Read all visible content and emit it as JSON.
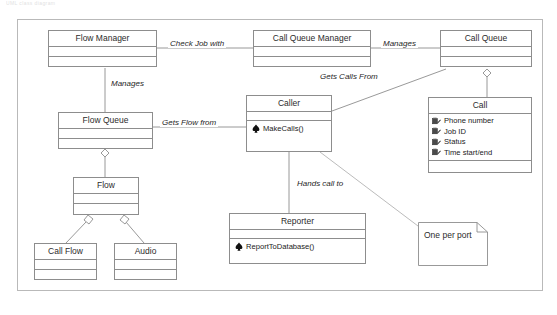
{
  "figure": {
    "top_sliver_text": "UML   class   diagram",
    "border_color": "#b9b9b9",
    "line_color": "#8d8d8d",
    "background": "#ffffff"
  },
  "classes": [
    {
      "id": "flow-manager",
      "name": "Flow Manager",
      "attributes": [],
      "operations": []
    },
    {
      "id": "call-queue-manager",
      "name": "Call Queue Manager",
      "attributes": [],
      "operations": []
    },
    {
      "id": "call-queue",
      "name": "Call Queue",
      "attributes": [],
      "operations": []
    },
    {
      "id": "flow-queue",
      "name": "Flow Queue",
      "attributes": [],
      "operations": []
    },
    {
      "id": "caller",
      "name": "Caller",
      "attributes": [],
      "operations": [
        "MakeCalls()"
      ]
    },
    {
      "id": "call",
      "name": "Call",
      "attributes": [
        "Phone number",
        "Job ID",
        "Status",
        "Time start/end"
      ],
      "operations": []
    },
    {
      "id": "flow",
      "name": "Flow",
      "attributes": [],
      "operations": []
    },
    {
      "id": "call-flow",
      "name": "Call Flow",
      "attributes": [],
      "operations": []
    },
    {
      "id": "audio",
      "name": "Audio",
      "attributes": [],
      "operations": []
    },
    {
      "id": "reporter",
      "name": "Reporter",
      "attributes": [],
      "operations": [
        "ReportToDatabase()"
      ]
    }
  ],
  "notes": [
    {
      "id": "one-per-port",
      "text": "One per port"
    }
  ],
  "relationships": [
    {
      "id": "check-job-with",
      "label": "Check Job with",
      "from": "Flow Manager",
      "to": "Call Queue Manager",
      "kind": "association"
    },
    {
      "id": "manages-queue",
      "label": "Manages",
      "from": "Call Queue Manager",
      "to": "Call Queue",
      "kind": "association"
    },
    {
      "id": "manages-flow",
      "label": "Manages",
      "from": "Flow Manager",
      "to": "Flow Queue",
      "kind": "association"
    },
    {
      "id": "gets-flow-from",
      "label": "Gets Flow from",
      "from": "Flow Queue",
      "to": "Caller",
      "kind": "association"
    },
    {
      "id": "gets-calls-from",
      "label": "Gets Calls From",
      "from": "Caller",
      "to": "Call Queue",
      "kind": "association"
    },
    {
      "id": "hands-call-to",
      "label": "Hands call to",
      "from": "Caller",
      "to": "Reporter",
      "kind": "association"
    },
    {
      "id": "queue-has-call",
      "label": "",
      "from": "Call Queue",
      "to": "Call",
      "kind": "aggregation"
    },
    {
      "id": "flowqueue-has-flow",
      "label": "",
      "from": "Flow Queue",
      "to": "Flow",
      "kind": "aggregation"
    },
    {
      "id": "flow-has-callflow",
      "label": "",
      "from": "Flow",
      "to": "Call Flow",
      "kind": "aggregation"
    },
    {
      "id": "flow-has-audio",
      "label": "",
      "from": "Flow",
      "to": "Audio",
      "kind": "aggregation"
    },
    {
      "id": "note-anchor",
      "label": "",
      "from": "Caller",
      "to": "One per port",
      "kind": "note-link"
    }
  ],
  "icons": {
    "attribute": "attribute-field-icon",
    "operation": "operation-method-icon"
  }
}
